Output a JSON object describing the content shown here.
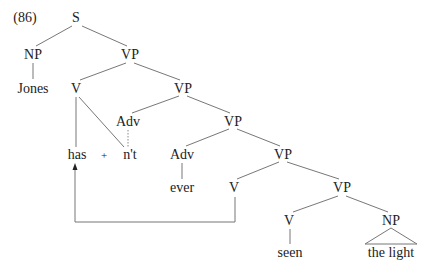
{
  "example_number": "(86)",
  "nodes": {
    "s": "S",
    "np_subj": "NP",
    "jones": "Jones",
    "vp1": "VP",
    "v_aux": "V",
    "vp2": "VP",
    "adv_neg": "Adv",
    "has": "has",
    "plus": "+",
    "nt": "n't",
    "vp3": "VP",
    "adv_ever": "Adv",
    "ever": "ever",
    "vp4": "VP",
    "v_trace": "V",
    "vp5": "VP",
    "v_main": "V",
    "seen": "seen",
    "np_obj": "NP",
    "the_light": "the light"
  },
  "annotations": {
    "movement_arrow": "V to has (head movement)",
    "dotted_link": "Adv to n't"
  }
}
